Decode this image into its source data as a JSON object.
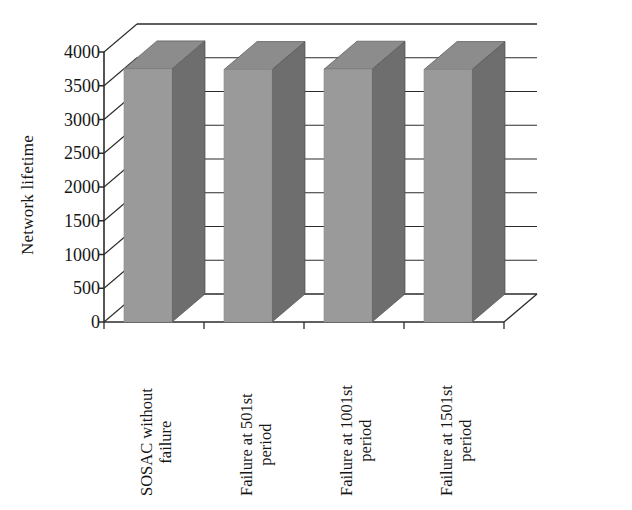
{
  "chart_data": {
    "type": "bar",
    "title": "",
    "subtitle": "",
    "xlabel": "",
    "ylabel": "Network lifetime",
    "categories": [
      "SOSAC without failure",
      "Failure at 501st period",
      "Failure at 1001st period",
      "Failure at 1501st period"
    ],
    "category_lines": [
      [
        "SOSAC without",
        "failure"
      ],
      [
        "Failure at 501st",
        "period"
      ],
      [
        "Failure at 1001st",
        "period"
      ],
      [
        "Failure at 1501st",
        "period"
      ]
    ],
    "values": [
      3750,
      3740,
      3745,
      3740
    ],
    "ylim": [
      0,
      4000
    ],
    "ytick_values": [
      4000,
      3500,
      3000,
      2500,
      2000,
      1500,
      1000,
      500,
      0
    ],
    "ytick_labels": [
      "4000",
      "3500",
      "3000",
      "2500",
      "2000",
      "1500",
      "1000",
      "500",
      "0"
    ],
    "ytick_step": 500,
    "grid": true,
    "grid_axis": "y",
    "legend": null,
    "legend_position": "none",
    "projection": "3d",
    "series": [
      {
        "name": "Network lifetime",
        "values": [
          3750,
          3740,
          3745,
          3740
        ]
      }
    ],
    "colors": {
      "bar_front": "#9a9a9a",
      "bar_side": "#6e6e6e",
      "bar_top": "#8c8c8c",
      "axis": "#2b2b2b",
      "grid": "#2b2b2b",
      "background": "#ffffff",
      "text": "#161616"
    }
  },
  "axes": {
    "y_title": "Network lifetime"
  }
}
